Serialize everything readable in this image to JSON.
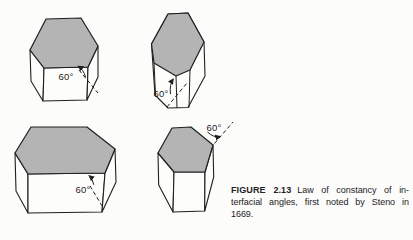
{
  "colors": {
    "background": "#fcfcfb",
    "line": "#1f1f1f",
    "face_shading": "#b4b4b4"
  },
  "crystals": [
    {
      "angle_label": "60°"
    },
    {
      "angle_label": "60°"
    },
    {
      "angle_label": "60°"
    },
    {
      "angle_label": "60°"
    }
  ],
  "caption": {
    "label": "FIGURE 2.13",
    "line1": "Law of constancy of in-",
    "line2": "terfacial angles, first noted by Steno in",
    "line3": "1669."
  }
}
